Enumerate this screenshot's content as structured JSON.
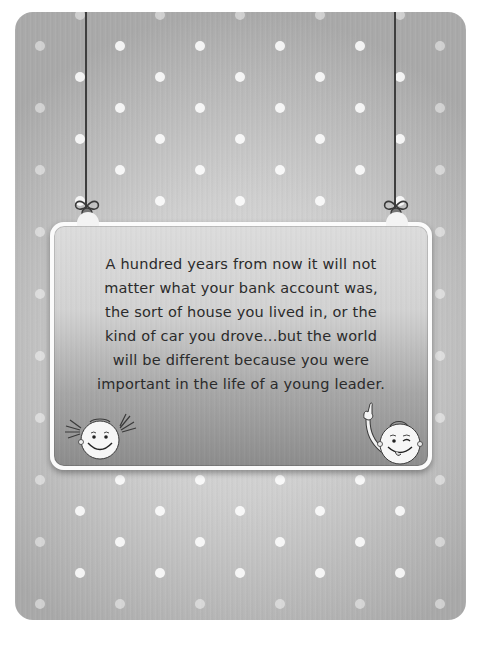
{
  "card": {
    "background_colors": [
      "#e2e2e2",
      "#cfcfcf",
      "#a9a9a9"
    ],
    "dot_color": "#ffffff"
  },
  "sign": {
    "border_color": "#fbfbfb",
    "gradient": [
      "#dcdcdc",
      "#8c8c8c"
    ],
    "quote_lines": [
      "A hundred years from now it will not",
      "matter what your bank account was,",
      "the sort of house you lived in, or the",
      "kind of car you drove...but the world",
      "will be different because you were",
      "important in the life of a young leader."
    ],
    "text_color": "#2b2b2b"
  },
  "decorations": {
    "left_string": "hanging-string",
    "right_string": "hanging-string",
    "left_bow": "bow-icon",
    "right_bow": "bow-icon",
    "girl": "smiling-girl-face-icon",
    "boy": "winking-boy-waving-icon"
  }
}
